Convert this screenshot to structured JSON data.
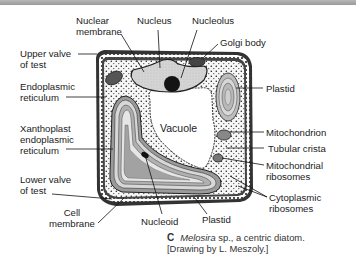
{
  "figure": {
    "labels": {
      "nuclear_membrane": [
        "Nuclear",
        "membrane"
      ],
      "nucleus": "Nucleus",
      "nucleolus": "Nucleolus",
      "golgi_body": "Golgi body",
      "upper_valve": [
        "Upper valve",
        "of test"
      ],
      "endoplasmic_reticulum": [
        "Endoplasmic",
        "reticulum"
      ],
      "plastid_right": "Plastid",
      "vacuole": "Vacuole",
      "xanthoplast_er": [
        "Xanthoplast",
        "endoplasmic",
        "reticulum"
      ],
      "mitochondrion": "Mitochondrion",
      "tubular_crista": "Tubular crista",
      "mitochondrial_ribosomes": [
        "Mitochondrial",
        "ribosomes"
      ],
      "lower_valve": [
        "Lower valve",
        "of test"
      ],
      "cell_membrane": [
        "Cell",
        "membrane"
      ],
      "nucleoid": "Nucleoid",
      "plastid_bottom": "Plastid",
      "cytoplasmic_ribosomes": [
        "Cytoplasmic",
        "ribosomes"
      ]
    },
    "caption": {
      "letter": "C",
      "genus": "Melosira",
      "rest": " sp., a centric diatom.",
      "credit": "[Drawing by L. Meszoly.]"
    },
    "colors": {
      "ink": "#1a1a1a",
      "cytoplasm": "#f4f4f4",
      "nucleus_fill": "#cfcfcf",
      "nucleolus_fill": "#141414",
      "border_bar": "#a8a8a8"
    }
  }
}
